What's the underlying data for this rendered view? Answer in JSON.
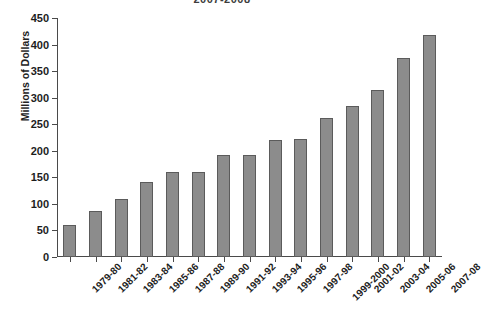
{
  "chart_data": {
    "type": "bar",
    "title": "2007-2008",
    "xlabel": "",
    "ylabel": "Millions of Dollars",
    "ylim": [
      0,
      450
    ],
    "ytick_values": [
      0,
      50,
      100,
      150,
      200,
      250,
      300,
      350,
      400,
      450
    ],
    "ytick_labels": [
      "0",
      "50",
      "100",
      "150",
      "200",
      "250",
      "300",
      "350",
      "400",
      "450"
    ],
    "grid": false,
    "legend": false,
    "bar_color": "#8c8c8c",
    "bar_edge_color": "#5b5b5b",
    "categories": [
      "1979-80",
      "1981-82",
      "1983-84",
      "1985-86",
      "1987-88",
      "1989-90",
      "1991-92",
      "1993-94",
      "1995-96",
      "1997-98",
      "1999-2000",
      "2001-02",
      "2003-04",
      "2005-06",
      "2007-08"
    ],
    "values": [
      60,
      87,
      110,
      141,
      160,
      160,
      192,
      192,
      220,
      222,
      262,
      285,
      315,
      375,
      418
    ]
  }
}
